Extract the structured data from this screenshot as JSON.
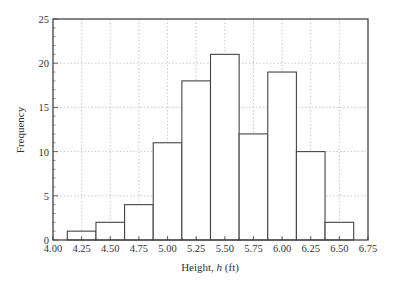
{
  "chart_data": {
    "type": "bar",
    "subtype": "histogram",
    "title": "",
    "xlabel": "Height, h (ft)",
    "xlabel_parts": [
      "Height, ",
      "h",
      " (ft)"
    ],
    "ylabel": "Frequency",
    "bin_width": 0.25,
    "categories": [
      "4.25",
      "4.50",
      "4.75",
      "5.00",
      "5.25",
      "5.50",
      "5.75",
      "6.00",
      "6.25",
      "6.50"
    ],
    "bin_centers": [
      4.25,
      4.5,
      4.75,
      5.0,
      5.25,
      5.5,
      5.75,
      6.0,
      6.25,
      6.5
    ],
    "values": [
      1,
      2,
      4,
      11,
      18,
      21,
      12,
      19,
      10,
      2
    ],
    "xlim": [
      4.0,
      6.75
    ],
    "ylim": [
      0,
      25
    ],
    "xticks": [
      "4.00",
      "4.25",
      "4.50",
      "4.75",
      "5.00",
      "5.25",
      "5.50",
      "5.75",
      "6.00",
      "6.25",
      "6.50",
      "6.75"
    ],
    "yticks": [
      "0",
      "5",
      "10",
      "15",
      "20",
      "25"
    ],
    "grid": true,
    "grid_style": "dotted",
    "legend": null
  },
  "colors": {
    "axis": "#444444",
    "bar_edge": "#444444",
    "bar_fill": "#ffffff",
    "grid": "#bbbbbb",
    "text": "#333333"
  }
}
